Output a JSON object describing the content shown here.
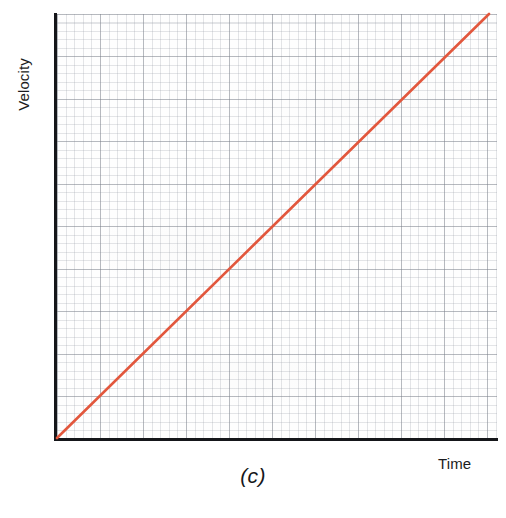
{
  "figure": {
    "caption": "(c)",
    "background_color": "#ffffff"
  },
  "axes": {
    "y_label": "Velocity",
    "x_label": "Time",
    "axis_color": "#15161a",
    "grid_major_color": "#787d87",
    "grid_minor_color": "#969ba5"
  },
  "chart_data": {
    "type": "line",
    "title": "",
    "subtitle": "",
    "xlabel": "Time",
    "ylabel": "Velocity",
    "caption": "(c)",
    "grid": true,
    "grid_style": "graph-paper",
    "legend": null,
    "legend_position": "none",
    "xlim": [
      0,
      10
    ],
    "ylim": [
      0,
      10
    ],
    "x_tick_labels": [],
    "y_tick_labels": [],
    "annotations": [],
    "series": [
      {
        "name": "velocity",
        "color": "#e2573d",
        "line_width": 2.6,
        "x": [
          0,
          1,
          2,
          3,
          4,
          5,
          6,
          7,
          8,
          9,
          10
        ],
        "values": [
          0,
          1,
          2,
          3,
          4,
          5,
          6,
          7,
          8,
          9,
          10
        ],
        "description": "straight line through the origin with constant positive slope (uniform acceleration)"
      }
    ]
  }
}
